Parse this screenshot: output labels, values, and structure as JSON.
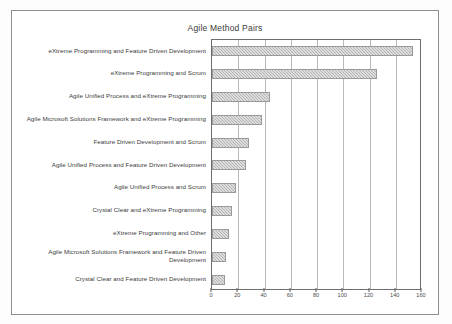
{
  "chart_data": {
    "type": "bar",
    "orientation": "horizontal",
    "title": "Agile Method Pairs",
    "xlabel": "",
    "ylabel": "",
    "xlim": [
      0,
      160
    ],
    "xticks": [
      0,
      20,
      40,
      60,
      80,
      100,
      120,
      140,
      160
    ],
    "grid": true,
    "legend": false,
    "bar_color": "#b4b4b4",
    "bar_edge_color": "#9a9a9a",
    "categories": [
      "eXtreme Programming and Feature Driven Development",
      "eXtreme Programming and Scrum",
      "Agile Unified Process and eXtreme Programming",
      "Agile Microsoft Solutions Framework and eXtreme Programming",
      "Feature Driven Development and Scrum",
      "Agile Unified Process and Feature Driven Development",
      "Agile Unified Process and Scrum",
      "Crystal Clear and eXtreme Programming",
      "eXtreme Programming and Other",
      "Agile Microsoft Solutions Framework and Feature Driven Development",
      "Crystal Clear and Feature Driven Development"
    ],
    "values": [
      153,
      126,
      44,
      38,
      28,
      26,
      18,
      15,
      13,
      11,
      10
    ]
  }
}
